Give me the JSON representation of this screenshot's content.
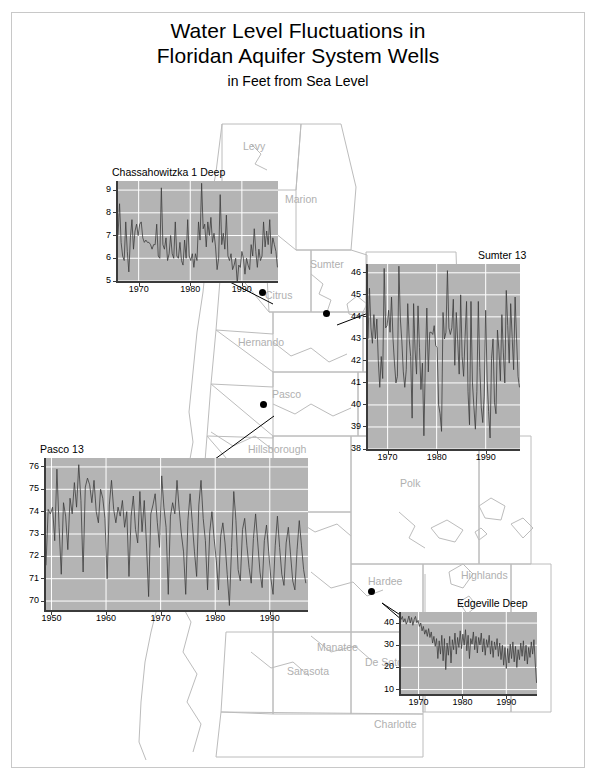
{
  "title": {
    "line1": "Water Level Fluctuations in",
    "line2": "Floridan Aquifer System Wells",
    "subtitle": "in Feet from Sea Level"
  },
  "colors": {
    "plot_background": "#b4b4b4",
    "gridline": "#ffffff",
    "series_line": "#3c3c3c",
    "county_border": "#b9b9b9",
    "county_label": "#b0b0b0",
    "frame": "#c8c8c8",
    "marker": "#000000"
  },
  "map": {
    "counties": [
      {
        "name": "Levy",
        "x": 243,
        "y": 140
      },
      {
        "name": "Marion",
        "x": 285,
        "y": 193
      },
      {
        "name": "Sumter",
        "x": 310,
        "y": 258
      },
      {
        "name": "Citrus",
        "x": 265,
        "y": 289
      },
      {
        "name": "Hernando",
        "x": 238,
        "y": 336
      },
      {
        "name": "Pasco",
        "x": 272,
        "y": 388
      },
      {
        "name": "Hillsborough",
        "x": 248,
        "y": 443
      },
      {
        "name": "Polk",
        "x": 400,
        "y": 477
      },
      {
        "name": "Hardee",
        "x": 368,
        "y": 575
      },
      {
        "name": "Highlands",
        "x": 461,
        "y": 569
      },
      {
        "name": "Manatee",
        "x": 317,
        "y": 641
      },
      {
        "name": "De Soto",
        "x": 365,
        "y": 656
      },
      {
        "name": "Sarasota",
        "x": 287,
        "y": 665
      },
      {
        "name": "Charlotte",
        "x": 374,
        "y": 718
      }
    ],
    "well_markers": [
      {
        "name": "chassahowitzka-1-deep-marker",
        "x": 262,
        "y": 292
      },
      {
        "name": "sumter-13-marker",
        "x": 326,
        "y": 313
      },
      {
        "name": "pasco-13-marker",
        "x": 263,
        "y": 404
      },
      {
        "name": "edgeville-deep-marker",
        "x": 371,
        "y": 591
      }
    ]
  },
  "chart_data": [
    {
      "id": "chassahowitzka-1-deep",
      "type": "line",
      "title": "Chassahowitzka 1 Deep",
      "xlabel": "",
      "ylabel": "",
      "xlim": [
        1966,
        1997
      ],
      "ylim": [
        5,
        9.4
      ],
      "xticks": [
        1970,
        1980,
        1990
      ],
      "yticks": [
        5,
        6,
        7,
        8,
        9
      ],
      "grid": true,
      "legend": "none",
      "x": [
        1966.0,
        1966.3,
        1966.6,
        1966.9,
        1967.2,
        1967.5,
        1967.8,
        1968.1,
        1968.4,
        1968.7,
        1969.0,
        1969.3,
        1969.6,
        1969.9,
        1970.2,
        1970.5,
        1970.8,
        1971.1,
        1971.4,
        1971.7,
        1972.0,
        1972.3,
        1972.6,
        1972.9,
        1973.2,
        1973.5,
        1973.8,
        1974.1,
        1974.4,
        1974.7,
        1975.0,
        1975.3,
        1975.6,
        1975.9,
        1976.2,
        1976.5,
        1976.8,
        1977.1,
        1977.4,
        1977.7,
        1978.0,
        1978.3,
        1978.6,
        1978.9,
        1979.2,
        1979.5,
        1979.8,
        1980.1,
        1980.4,
        1980.7,
        1981.0,
        1981.3,
        1981.6,
        1981.9,
        1982.2,
        1982.5,
        1982.8,
        1983.1,
        1983.4,
        1983.7,
        1984.0,
        1984.3,
        1984.6,
        1984.9,
        1985.2,
        1985.5,
        1985.8,
        1986.1,
        1986.4,
        1986.7,
        1987.0,
        1987.3,
        1987.6,
        1987.9,
        1988.2,
        1988.5,
        1988.8,
        1989.1,
        1989.4,
        1989.7,
        1990.0,
        1990.3,
        1990.6,
        1990.9,
        1991.2,
        1991.5,
        1991.8,
        1992.1,
        1992.4,
        1992.7,
        1993.0,
        1993.3,
        1993.6,
        1993.9,
        1994.2,
        1994.5,
        1994.8,
        1995.1,
        1995.4,
        1995.7,
        1996.0,
        1996.3,
        1996.6,
        1996.9
      ],
      "values": [
        7.0,
        8.4,
        6.7,
        6.1,
        5.9,
        7.6,
        6.3,
        5.4,
        6.9,
        7.7,
        6.4,
        7.2,
        7.5,
        7.0,
        7.5,
        7.6,
        6.9,
        6.7,
        6.8,
        6.7,
        6.7,
        6.6,
        6.4,
        6.6,
        6.6,
        7.5,
        6.1,
        6.0,
        9.1,
        6.6,
        6.4,
        6.9,
        5.9,
        6.2,
        7.0,
        6.2,
        6.0,
        7.6,
        6.1,
        6.0,
        6.7,
        5.9,
        5.7,
        6.8,
        6.0,
        7.7,
        6.1,
        5.9,
        6.2,
        5.6,
        6.2,
        5.9,
        7.6,
        6.8,
        9.3,
        7.3,
        7.5,
        6.5,
        7.6,
        7.0,
        7.8,
        6.7,
        7.1,
        6.5,
        5.5,
        6.0,
        8.8,
        6.6,
        7.1,
        6.4,
        7.9,
        6.1,
        5.9,
        6.2,
        5.5,
        5.7,
        6.0,
        4.9,
        5.7,
        5.6,
        6.3,
        6.0,
        5.3,
        6.0,
        5.7,
        5.5,
        6.6,
        6.1,
        7.3,
        6.3,
        5.6,
        6.4,
        5.9,
        6.1,
        7.6,
        6.5,
        7.2,
        6.6,
        7.7,
        6.2,
        6.9,
        6.6,
        6.3,
        5.6
      ]
    },
    {
      "id": "sumter-13",
      "type": "line",
      "title": "Sumter 13",
      "xlabel": "",
      "ylabel": "",
      "xlim": [
        1966,
        1997
      ],
      "ylim": [
        38,
        46.4
      ],
      "xticks": [
        1970,
        1980,
        1990
      ],
      "yticks": [
        38,
        39,
        40,
        41,
        42,
        43,
        44,
        45,
        46
      ],
      "grid": true,
      "legend": "none",
      "x": [
        1966.0,
        1966.3,
        1966.6,
        1966.9,
        1967.2,
        1967.5,
        1967.8,
        1968.1,
        1968.4,
        1968.7,
        1969.0,
        1969.3,
        1969.6,
        1969.9,
        1970.2,
        1970.5,
        1970.8,
        1971.1,
        1971.4,
        1971.7,
        1972.0,
        1972.3,
        1972.6,
        1972.9,
        1973.2,
        1973.5,
        1973.8,
        1974.1,
        1974.4,
        1974.7,
        1975.0,
        1975.3,
        1975.6,
        1975.9,
        1976.2,
        1976.5,
        1976.8,
        1977.1,
        1977.4,
        1977.7,
        1978.0,
        1978.3,
        1978.6,
        1978.9,
        1979.2,
        1979.5,
        1979.8,
        1980.1,
        1980.4,
        1980.7,
        1981.0,
        1981.3,
        1981.6,
        1981.9,
        1982.2,
        1982.5,
        1982.8,
        1983.1,
        1983.4,
        1983.7,
        1984.0,
        1984.3,
        1984.6,
        1984.9,
        1985.2,
        1985.5,
        1985.8,
        1986.1,
        1986.4,
        1986.7,
        1987.0,
        1987.3,
        1987.6,
        1987.9,
        1988.2,
        1988.5,
        1988.8,
        1989.1,
        1989.4,
        1989.7,
        1990.0,
        1990.3,
        1990.6,
        1990.9,
        1991.2,
        1991.5,
        1991.8,
        1992.1,
        1992.4,
        1992.7,
        1993.0,
        1993.3,
        1993.6,
        1993.9,
        1994.2,
        1994.5,
        1994.8,
        1995.1,
        1995.4,
        1995.7,
        1996.0,
        1996.3,
        1996.6,
        1996.9
      ],
      "values": [
        43.0,
        45.3,
        43.5,
        42.8,
        44.1,
        43.0,
        43.9,
        42.0,
        40.8,
        42.2,
        41.2,
        46.2,
        43.5,
        43.6,
        44.3,
        43.3,
        44.9,
        43.0,
        41.9,
        41.0,
        41.3,
        46.3,
        43.9,
        42.9,
        41.5,
        40.8,
        41.6,
        44.6,
        43.0,
        42.2,
        39.4,
        44.6,
        42.5,
        41.4,
        44.5,
        42.6,
        40.7,
        41.9,
        38.6,
        42.0,
        44.4,
        41.5,
        43.3,
        43.3,
        43.2,
        43.6,
        42.7,
        42.6,
        40.0,
        39.6,
        38.8,
        44.2,
        43.0,
        43.3,
        46.1,
        43.5,
        43.2,
        43.5,
        44.8,
        41.8,
        44.2,
        42.9,
        41.4,
        45.0,
        42.2,
        41.3,
        43.1,
        44.7,
        40.6,
        39.1,
        44.7,
        41.0,
        39.9,
        38.9,
        40.6,
        44.7,
        41.7,
        39.9,
        39.2,
        40.4,
        44.3,
        41.1,
        39.7,
        38.5,
        42.1,
        43.0,
        40.1,
        39.6,
        43.4,
        42.5,
        41.1,
        44.1,
        42.4,
        41.0,
        45.2,
        43.6,
        41.9,
        44.6,
        43.1,
        41.6,
        44.9,
        43.0,
        41.3,
        40.8
      ]
    },
    {
      "id": "pasco-13",
      "type": "line",
      "title": "Pasco 13",
      "xlabel": "",
      "ylabel": "",
      "xlim": [
        1949,
        1997
      ],
      "ylim": [
        69.6,
        76.4
      ],
      "xticks": [
        1950,
        1960,
        1970,
        1980,
        1990
      ],
      "yticks": [
        70,
        71,
        72,
        73,
        74,
        75,
        76
      ],
      "grid": true,
      "legend": "none",
      "x": [
        1949.0,
        1949.4,
        1949.8,
        1950.2,
        1950.6,
        1951.0,
        1951.4,
        1951.8,
        1952.2,
        1952.6,
        1953.0,
        1953.4,
        1953.8,
        1954.2,
        1954.6,
        1955.0,
        1955.4,
        1955.8,
        1956.2,
        1956.6,
        1957.0,
        1957.4,
        1957.8,
        1958.2,
        1958.6,
        1959.0,
        1959.4,
        1959.8,
        1960.2,
        1960.6,
        1961.0,
        1961.4,
        1961.8,
        1962.2,
        1962.6,
        1963.0,
        1963.4,
        1963.8,
        1964.2,
        1964.6,
        1965.0,
        1965.4,
        1965.8,
        1966.2,
        1966.6,
        1967.0,
        1967.4,
        1967.8,
        1968.2,
        1968.6,
        1969.0,
        1969.4,
        1969.8,
        1970.2,
        1970.6,
        1971.0,
        1971.4,
        1971.8,
        1972.2,
        1972.6,
        1973.0,
        1973.4,
        1973.8,
        1974.2,
        1974.6,
        1975.0,
        1975.4,
        1975.8,
        1976.2,
        1976.6,
        1977.0,
        1977.4,
        1977.8,
        1978.2,
        1978.6,
        1979.0,
        1979.4,
        1979.8,
        1980.2,
        1980.6,
        1981.0,
        1981.4,
        1981.8,
        1982.2,
        1982.6,
        1983.0,
        1983.4,
        1983.8,
        1984.2,
        1984.6,
        1985.0,
        1985.4,
        1985.8,
        1986.2,
        1986.6,
        1987.0,
        1987.4,
        1987.8,
        1988.2,
        1988.6,
        1989.0,
        1989.4,
        1989.8,
        1990.2,
        1990.6,
        1991.0,
        1991.4,
        1991.8,
        1992.2,
        1992.6,
        1993.0,
        1993.4,
        1993.8,
        1994.2,
        1994.6,
        1995.0,
        1995.4,
        1995.8,
        1996.2,
        1996.6
      ],
      "values": [
        71.6,
        74.1,
        73.9,
        74.2,
        72.7,
        75.9,
        73.3,
        71.2,
        74.4,
        73.8,
        72.3,
        74.6,
        73.9,
        75.3,
        74.2,
        76.1,
        74.5,
        71.3,
        75.1,
        75.5,
        75.2,
        74.4,
        75.4,
        74.0,
        73.5,
        75.0,
        74.6,
        73.7,
        71.0,
        74.3,
        75.4,
        74.1,
        73.5,
        74.2,
        73.8,
        74.5,
        73.3,
        74.0,
        71.1,
        73.8,
        74.7,
        73.2,
        72.6,
        74.9,
        73.1,
        74.5,
        72.6,
        70.2,
        73.9,
        74.3,
        74.8,
        73.5,
        72.4,
        75.6,
        74.2,
        73.3,
        70.3,
        73.8,
        74.4,
        73.9,
        75.4,
        74.1,
        73.0,
        72.2,
        70.3,
        73.6,
        74.8,
        73.5,
        72.2,
        71.1,
        74.3,
        75.4,
        73.7,
        72.7,
        70.5,
        73.1,
        74.0,
        72.8,
        71.8,
        70.5,
        72.9,
        73.5,
        72.6,
        71.2,
        69.8,
        72.4,
        74.9,
        73.6,
        71.4,
        70.9,
        73.2,
        73.7,
        72.5,
        71.5,
        70.8,
        72.8,
        73.9,
        72.6,
        71.3,
        70.6,
        72.7,
        73.4,
        72.2,
        71.0,
        70.3,
        72.5,
        73.8,
        72.4,
        71.2,
        70.7,
        72.6,
        73.3,
        72.1,
        70.9,
        70.5,
        72.3,
        73.6,
        72.5,
        71.4,
        70.8
      ]
    },
    {
      "id": "edgeville-deep",
      "type": "line",
      "title": "Edgeville Deep",
      "xlabel": "",
      "ylabel": "",
      "xlim": [
        1966,
        1997
      ],
      "ylim": [
        8,
        45
      ],
      "xticks": [
        1970,
        1980,
        1990
      ],
      "yticks": [
        10,
        20,
        30,
        40
      ],
      "grid": true,
      "legend": "none",
      "x": [
        1966.0,
        1966.3,
        1966.6,
        1966.9,
        1967.2,
        1967.5,
        1967.8,
        1968.1,
        1968.4,
        1968.7,
        1969.0,
        1969.3,
        1969.6,
        1969.9,
        1970.2,
        1970.5,
        1970.8,
        1971.1,
        1971.4,
        1971.7,
        1972.0,
        1972.3,
        1972.6,
        1972.9,
        1973.2,
        1973.5,
        1973.8,
        1974.1,
        1974.4,
        1974.7,
        1975.0,
        1975.3,
        1975.6,
        1975.9,
        1976.2,
        1976.5,
        1976.8,
        1977.1,
        1977.4,
        1977.7,
        1978.0,
        1978.3,
        1978.6,
        1978.9,
        1979.2,
        1979.5,
        1979.8,
        1980.1,
        1980.4,
        1980.7,
        1981.0,
        1981.3,
        1981.6,
        1981.9,
        1982.2,
        1982.5,
        1982.8,
        1983.1,
        1983.4,
        1983.7,
        1984.0,
        1984.3,
        1984.6,
        1984.9,
        1985.2,
        1985.5,
        1985.8,
        1986.1,
        1986.4,
        1986.7,
        1987.0,
        1987.3,
        1987.6,
        1987.9,
        1988.2,
        1988.5,
        1988.8,
        1989.1,
        1989.4,
        1989.7,
        1990.0,
        1990.3,
        1990.6,
        1990.9,
        1991.2,
        1991.5,
        1991.8,
        1992.1,
        1992.4,
        1992.7,
        1993.0,
        1993.3,
        1993.6,
        1993.9,
        1994.2,
        1994.5,
        1994.8,
        1995.1,
        1995.4,
        1995.7,
        1996.0,
        1996.3,
        1996.6,
        1996.9
      ],
      "values": [
        41.5,
        43.0,
        40.5,
        42.0,
        39.5,
        41.0,
        43.2,
        40.0,
        42.5,
        39.0,
        41.6,
        43.0,
        40.2,
        41.2,
        38.5,
        40.0,
        36.5,
        38.5,
        35.0,
        37.0,
        34.0,
        37.5,
        33.5,
        36.0,
        31.0,
        34.0,
        29.5,
        33.0,
        24.0,
        32.0,
        26.0,
        34.5,
        23.0,
        33.0,
        19.0,
        31.0,
        25.5,
        34.0,
        22.0,
        32.5,
        28.0,
        35.5,
        26.0,
        33.5,
        29.0,
        36.5,
        28.5,
        35.0,
        30.0,
        37.0,
        27.5,
        34.5,
        24.0,
        33.0,
        30.5,
        36.0,
        28.0,
        34.0,
        26.5,
        33.5,
        30.0,
        35.5,
        27.0,
        33.0,
        25.5,
        32.5,
        29.0,
        34.5,
        26.0,
        32.0,
        24.5,
        31.5,
        28.0,
        33.0,
        25.0,
        31.0,
        23.5,
        30.0,
        21.0,
        29.0,
        19.5,
        28.5,
        22.0,
        30.5,
        24.0,
        31.5,
        22.5,
        29.5,
        20.0,
        28.0,
        23.5,
        31.0,
        25.0,
        32.0,
        23.0,
        30.0,
        21.5,
        29.0,
        24.5,
        31.5,
        26.0,
        32.5,
        22.0,
        13.0
      ]
    }
  ]
}
